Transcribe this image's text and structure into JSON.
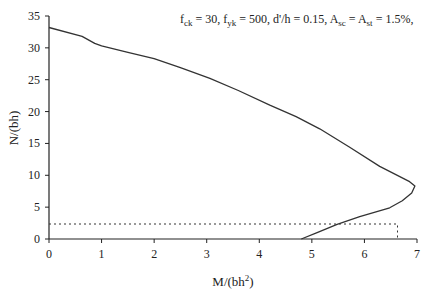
{
  "chart_data": {
    "type": "line",
    "title": "",
    "annotation": {
      "text_parts": [
        {
          "t": "f",
          "sub": "ck",
          "rest": " = 30, "
        },
        {
          "t": "f",
          "sub": "yk",
          "rest": " = 500, d'/h = 0.15, "
        },
        {
          "t": "A",
          "sub": "sc",
          "rest": " = "
        },
        {
          "t": "A",
          "sub": "st",
          "rest": " = 1.5%,"
        }
      ],
      "plain": "fck = 30, fyk = 500, d'/h = 0.15, Asc = Ast = 1.5%,"
    },
    "xlabel": "M/(bh²)",
    "xlabel_main": "M/(bh",
    "xlabel_sup": "2",
    "xlabel_close": ")",
    "ylabel": "N/(bh)",
    "xlim": [
      0,
      7
    ],
    "ylim": [
      0,
      35
    ],
    "xticks": [
      0,
      1,
      2,
      3,
      4,
      5,
      6,
      7
    ],
    "yticks": [
      0,
      5,
      10,
      15,
      20,
      25,
      30,
      35
    ],
    "grid": false,
    "legend": null,
    "series": [
      {
        "name": "Interaction curve",
        "style": "solid",
        "color": "#333333",
        "points": [
          [
            0.0,
            33.2
          ],
          [
            0.63,
            31.8
          ],
          [
            0.87,
            30.7
          ],
          [
            1.0,
            30.3
          ],
          [
            1.5,
            29.3
          ],
          [
            2.0,
            28.3
          ],
          [
            2.5,
            26.9
          ],
          [
            3.06,
            25.2
          ],
          [
            3.6,
            23.3
          ],
          [
            4.2,
            21.0
          ],
          [
            4.7,
            19.2
          ],
          [
            5.15,
            17.3
          ],
          [
            5.72,
            14.4
          ],
          [
            6.29,
            11.4
          ],
          [
            6.86,
            9.0
          ],
          [
            6.96,
            8.3
          ],
          [
            6.9,
            7.2
          ],
          [
            6.72,
            6.0
          ],
          [
            6.48,
            4.9
          ],
          [
            5.91,
            3.5
          ],
          [
            5.48,
            2.3
          ],
          [
            5.1,
            1.0
          ],
          [
            4.8,
            0.0
          ]
        ]
      },
      {
        "name": "Reference box",
        "style": "dotted",
        "color": "#333333",
        "points": [
          [
            0.0,
            2.35
          ],
          [
            6.63,
            2.35
          ],
          [
            6.63,
            0.0
          ]
        ]
      }
    ]
  }
}
